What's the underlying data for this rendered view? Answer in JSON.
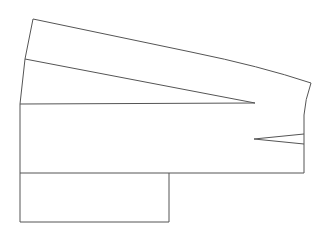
{
  "diagram": {
    "type": "sewing-pattern-outline",
    "width": 329,
    "height": 239,
    "background": "#ffffff",
    "stroke_color": "#555555",
    "outline_path": "M33,19 L191,52 Q260,66 311,83 Q305,100 304,115 L304,173 L20,173 L20,104 L25,59 Z",
    "upper_panel_path": "M33,19 L191,52 Q260,66 311,83",
    "slanted_line": {
      "x1": 25,
      "y1": 59,
      "x2": 255,
      "y2": 103
    },
    "horizontal_line": {
      "x1": 20,
      "y1": 104,
      "x2": 255,
      "y2": 103
    },
    "small_dart": {
      "tip": [
        254,
        139
      ],
      "upper_end": [
        304,
        134
      ],
      "lower_end": [
        304,
        144
      ]
    },
    "lower_box": {
      "x1": 20,
      "y1": 173,
      "x2": 169,
      "y2": 222
    }
  }
}
